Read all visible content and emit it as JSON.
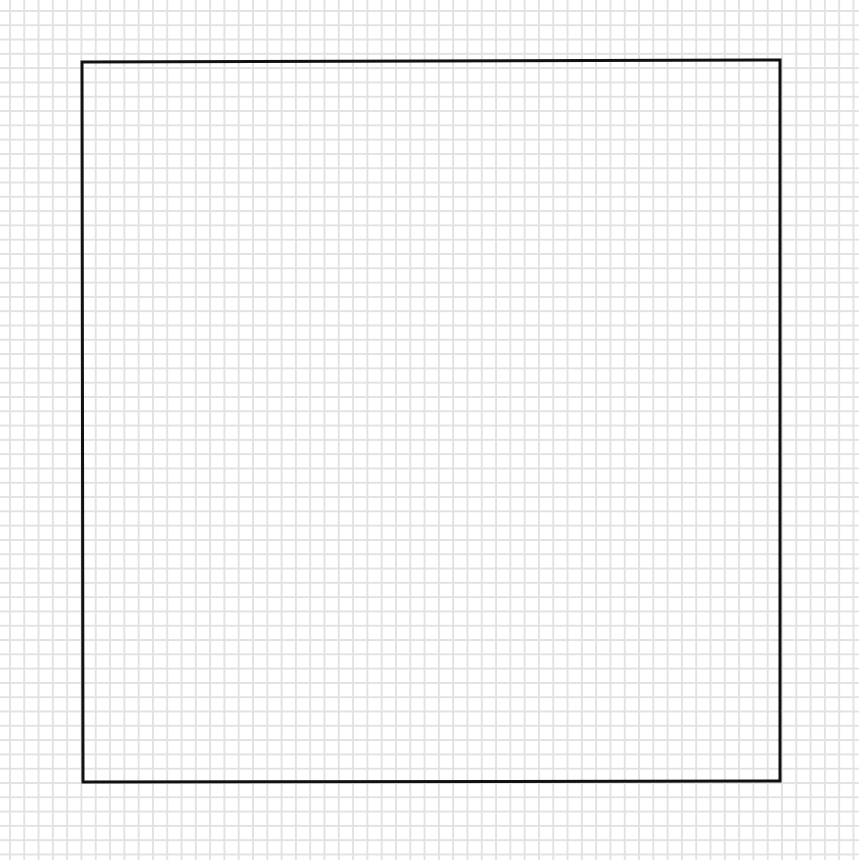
{
  "canvas": {
    "width": 859,
    "height": 860,
    "background": "#ffffff"
  },
  "grid": {
    "line_color": "#e2e2e2",
    "spacing_px": 14.3
  },
  "shape": {
    "type": "square",
    "stroke_color": "#111111",
    "stroke_width": 3,
    "corners": {
      "top_left": [
        82,
        62
      ],
      "top_right": [
        780,
        60
      ],
      "bottom_right": [
        780,
        781
      ],
      "bottom_left": [
        83,
        782
      ]
    }
  }
}
